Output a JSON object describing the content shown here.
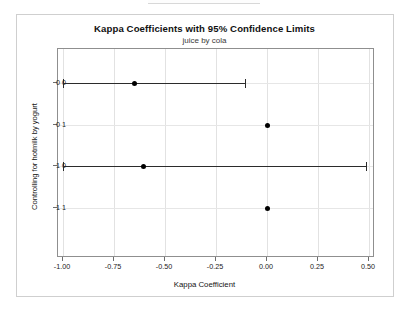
{
  "chart_data": {
    "type": "scatter",
    "title": "Kappa Coefficients with 95% Confidence Limits",
    "subtitle": "juice by cola",
    "xlabel": "Kappa Coefficient",
    "ylabel": "Controlling for hotmilk by yogurt",
    "xlim": [
      -1.0,
      0.5
    ],
    "ylim_categories": [
      "0 0",
      "0 1",
      "1 0",
      "1 1"
    ],
    "xticks": [
      -1.0,
      -0.75,
      -0.5,
      -0.25,
      0.0,
      0.25,
      0.5
    ],
    "xtick_labels": [
      "-1.00",
      "-0.75",
      "-0.50",
      "-0.25",
      "0.00",
      "0.25",
      "0.50"
    ],
    "categories": [
      "0 0",
      "0 1",
      "1 0",
      "1 1"
    ],
    "grid": true,
    "legend": "none",
    "series": [
      {
        "name": "Kappa estimate with 95% confidence limits",
        "points": [
          {
            "category": "0 0",
            "estimate": -0.65,
            "lower": -1.0,
            "upper": -0.11,
            "has_interval": true
          },
          {
            "category": "0 1",
            "estimate": 0.0,
            "lower": null,
            "upper": null,
            "has_interval": false
          },
          {
            "category": "1 0",
            "estimate": -0.61,
            "lower": -1.0,
            "upper": 0.485,
            "has_interval": true
          },
          {
            "category": "1 1",
            "estimate": 0.0,
            "lower": null,
            "upper": null,
            "has_interval": false
          }
        ]
      }
    ],
    "colors": {
      "marker": "#000000",
      "interval": "#2b2b2b",
      "grid": "#e2e2e2",
      "axis": "#8f8f8f",
      "frame": "#cfcfcf",
      "background": "#ffffff"
    }
  },
  "xticks": [
    {
      "label": "-1.00"
    },
    {
      "label": "-0.75"
    },
    {
      "label": "-0.50"
    },
    {
      "label": "-0.25"
    },
    {
      "label": "0.00"
    },
    {
      "label": "0.25"
    },
    {
      "label": "0.50"
    }
  ],
  "yticks": [
    {
      "label": "0 0"
    },
    {
      "label": "0 1"
    },
    {
      "label": "1 0"
    },
    {
      "label": "1 1"
    }
  ]
}
